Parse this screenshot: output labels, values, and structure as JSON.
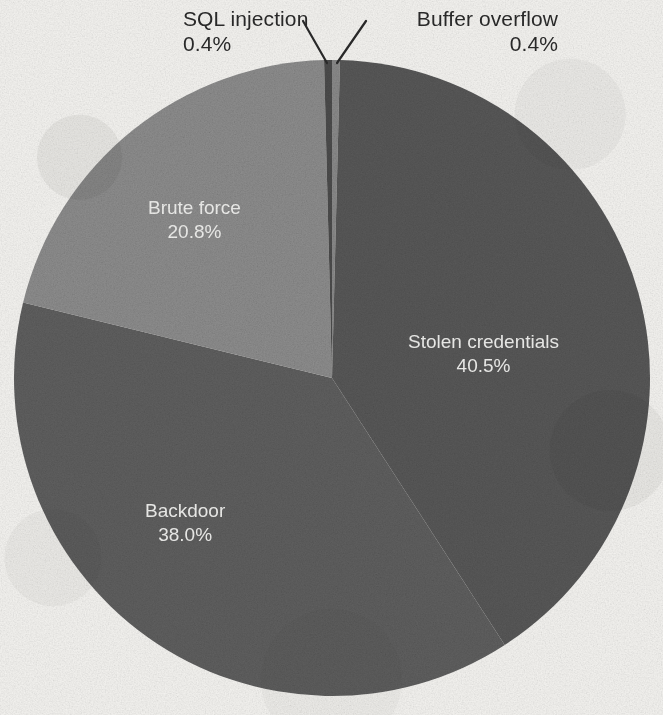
{
  "figure": {
    "background_color": "#f4f3f0",
    "label_text_color": "#2a2a2a",
    "slice_label_color": "#f0f0ee"
  },
  "chart_data": {
    "type": "pie",
    "title": "",
    "subtitle": "",
    "xlabel": "",
    "ylabel": "",
    "legend": "none",
    "grid": false,
    "label_format": "name + percent",
    "start_angle_deg": 90,
    "direction": "clockwise",
    "center": {
      "x": 332,
      "y": 378
    },
    "radius": 318,
    "categories": [
      "Buffer overflow",
      "Stolen credentials",
      "Backdoor",
      "Brute force",
      "SQL injection"
    ],
    "values": [
      0.4,
      40.5,
      38.0,
      20.8,
      0.4
    ],
    "unit": "%",
    "slices": [
      {
        "name": "Buffer overflow",
        "percent": "0.4%",
        "value": 0.4,
        "color": "#8d8d8d",
        "label_placement": "callout-outside",
        "label_position": "top-right"
      },
      {
        "name": "Stolen credentials",
        "percent": "40.5%",
        "value": 40.5,
        "color": "#5a5a5a",
        "label_placement": "inside",
        "label_position": "right"
      },
      {
        "name": "Backdoor",
        "percent": "38.0%",
        "value": 38.0,
        "color": "#616161",
        "label_placement": "inside",
        "label_position": "bottom-left"
      },
      {
        "name": "Brute force",
        "percent": "20.8%",
        "value": 20.8,
        "color": "#909090",
        "label_placement": "inside",
        "label_position": "top-left"
      },
      {
        "name": "SQL injection",
        "percent": "0.4%",
        "value": 0.4,
        "color": "#4e4e4e",
        "label_placement": "callout-outside",
        "label_position": "top-left"
      }
    ]
  },
  "callouts": {
    "sql_injection": {
      "name": "SQL injection",
      "percent": "0.4%"
    },
    "buffer_overflow": {
      "name": "Buffer overflow",
      "percent": "0.4%"
    }
  },
  "inner_labels": {
    "stolen_credentials": {
      "name": "Stolen credentials",
      "percent": "40.5%"
    },
    "backdoor": {
      "name": "Backdoor",
      "percent": "38.0%"
    },
    "brute_force": {
      "name": "Brute force",
      "percent": "20.8%"
    }
  }
}
